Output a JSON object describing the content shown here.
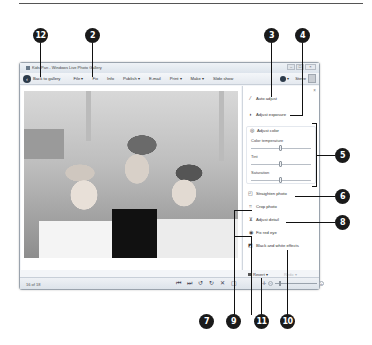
{
  "window": {
    "title": "Kids-Pan - Windows Live Photo Gallery",
    "controls": [
      "minimize",
      "maximize",
      "close"
    ]
  },
  "toolbar": {
    "back_label": "Back to gallery",
    "items": [
      {
        "label": "File ▾"
      },
      {
        "label": "Fix"
      },
      {
        "label": "Info"
      },
      {
        "label": "Publish ▾"
      },
      {
        "label": "E-mail"
      },
      {
        "label": "Print ▾"
      },
      {
        "label": "Make ▾"
      },
      {
        "label": "Slide show"
      }
    ],
    "help_label": "▾",
    "user_label": "Steve"
  },
  "fix_pane": {
    "close_label": "×",
    "auto_adjust": "Auto adjust",
    "adjust_exposure": "Adjust exposure",
    "adjust_color": "Adjust color",
    "sliders": [
      {
        "label": "Color temperature",
        "position": 0.5
      },
      {
        "label": "Tint",
        "position": 0.5
      },
      {
        "label": "Saturation",
        "position": 0.5
      }
    ],
    "straighten_photo": "Straighten photo",
    "crop_photo": "Crop photo",
    "adjust_detail": "Adjust detail",
    "fix_red_eye": "Fix red eye",
    "black_white_effects": "Black and white effects",
    "revert_label": "Revert ▾",
    "redo_label": "Redo ▾"
  },
  "statusbar": {
    "count": "16 of 18",
    "playback_icons": [
      "previous-icon",
      "next-icon",
      "rotate-left-icon",
      "rotate-right-icon",
      "delete-icon",
      "actual-size-icon"
    ],
    "playback_glyphs": [
      "⏮",
      "⏭",
      "↺",
      "↻",
      "✕",
      "▢"
    ],
    "fit_glyph": "✛",
    "zoom_minus": "−",
    "zoom_plus": "+"
  },
  "callouts": {
    "c12": "12",
    "c2": "2",
    "c3": "3",
    "c4": "4",
    "c5": "5",
    "c6": "6",
    "c7": "7",
    "c8": "8",
    "c9": "9",
    "c10": "10",
    "c11": "11"
  }
}
